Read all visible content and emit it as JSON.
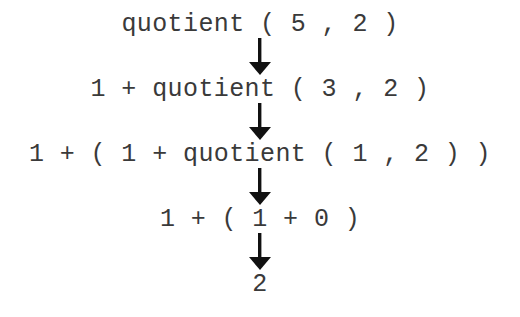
{
  "diagram": {
    "background_color": "#ffffff",
    "text_color": "#3a3a3a",
    "arrow_color": "#111111",
    "steps": [
      {
        "id": "step-1",
        "text": "quotient ( 5 , 2 )"
      },
      {
        "id": "step-2",
        "text": "1 + quotient ( 3 , 2 )"
      },
      {
        "id": "step-3",
        "text": "1 + ( 1 + quotient ( 1 , 2 ) )"
      },
      {
        "id": "step-4",
        "text": "1 + ( 1 + 0 )"
      },
      {
        "id": "step-5",
        "text": "2"
      }
    ],
    "arrows": [
      {
        "id": "arrow-1",
        "direction": "down"
      },
      {
        "id": "arrow-2",
        "direction": "down"
      },
      {
        "id": "arrow-3",
        "direction": "down"
      },
      {
        "id": "arrow-4",
        "direction": "down"
      }
    ]
  }
}
